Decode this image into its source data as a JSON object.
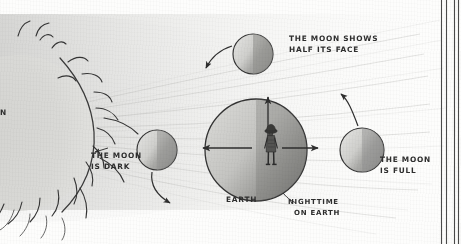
{
  "diagram": {
    "medium": "pencil sketch on paper",
    "labels": {
      "sun": "N",
      "earth": "EARTH",
      "nighttime_line1": "NIGHTTIME",
      "nighttime_line2": "ON EARTH",
      "moon_half_line1": "THE MOON SHOWS",
      "moon_half_line2": "HALF ITS FACE",
      "moon_dark_line1": "THE MOON",
      "moon_dark_line2": "IS DARK",
      "moon_full_line1": "THE MOON",
      "moon_full_line2": "IS FULL"
    },
    "colors": {
      "ink": "#2e2e2e",
      "paper": "#fdfdfc",
      "moon_lit": "#d8d8d6",
      "moon_shadow": "#8d8d8b",
      "earth_lit": "#c9c9c6",
      "earth_night": "#7c7c7a",
      "sunlight": "#dcdcda"
    },
    "bodies": [
      {
        "name": "sun",
        "cx": 18,
        "cy": 133,
        "r": 78,
        "lit_side": "self",
        "note": "cropped at left edge, corona flares"
      },
      {
        "name": "moon-half-top",
        "cx": 253,
        "cy": 54,
        "r": 20,
        "lit_side": "left"
      },
      {
        "name": "moon-dark-left",
        "cx": 157,
        "cy": 150,
        "r": 20,
        "lit_side": "left"
      },
      {
        "name": "moon-full-right",
        "cx": 362,
        "cy": 150,
        "r": 22,
        "lit_side": "left"
      },
      {
        "name": "earth",
        "cx": 256,
        "cy": 150,
        "r": 51,
        "lit_side": "left"
      }
    ],
    "orbit_arrows": [
      {
        "name": "arrow-top-moon",
        "direction": "down-left"
      },
      {
        "name": "arrow-left-moon",
        "direction": "down-right"
      },
      {
        "name": "arrow-right-moon",
        "direction": "up-left"
      }
    ],
    "earth_arrows": [
      {
        "name": "arrow-up",
        "direction": "up"
      },
      {
        "name": "arrow-left",
        "direction": "left"
      },
      {
        "name": "arrow-right",
        "direction": "right"
      }
    ],
    "border_rules": 4
  }
}
